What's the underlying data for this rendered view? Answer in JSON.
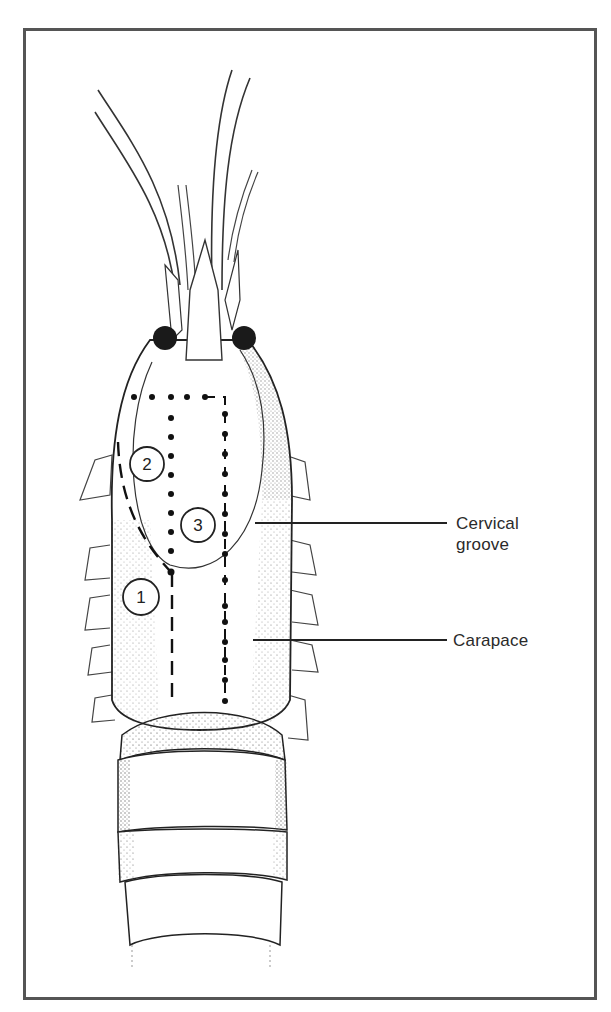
{
  "figure": {
    "type": "anatomical line drawing",
    "frame_color": "#555555",
    "ink_color": "#222222"
  },
  "labels": [
    {
      "id": "cervical-groove",
      "line1": "Cervical",
      "line2": "groove"
    },
    {
      "id": "carapace",
      "line1": "Carapace"
    }
  ],
  "regions": [
    {
      "number": "1",
      "line_style": "dashed"
    },
    {
      "number": "2",
      "line_style": "dotted"
    },
    {
      "number": "3",
      "line_style": "dash-dot"
    }
  ]
}
